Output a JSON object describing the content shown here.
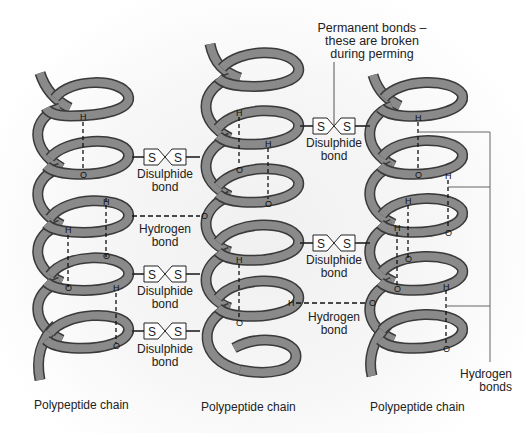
{
  "diagram": {
    "colors": {
      "helix_fill": "#8a8a8a",
      "helix_stroke": "#3a3a3a",
      "bond_line": "#222222",
      "background": "#f3f3f3"
    },
    "annotation_top": {
      "line1": "Permanent bonds –",
      "line2": "these are broken",
      "line3": "during perming"
    },
    "chains": [
      {
        "label": "Polypeptide chain",
        "position": "left"
      },
      {
        "label": "Polypeptide chain",
        "position": "middle"
      },
      {
        "label": "Polypeptide chain",
        "position": "right"
      }
    ],
    "bonds": [
      {
        "type": "disulphide",
        "between": "left-middle",
        "label1": "Disulphide",
        "label2": "bond",
        "atom1": "S",
        "atom2": "S"
      },
      {
        "type": "hydrogen",
        "between": "left-middle",
        "label1": "Hydrogen",
        "label2": "bond"
      },
      {
        "type": "disulphide",
        "between": "left-middle",
        "label1": "Disulphide",
        "label2": "bond",
        "atom1": "S",
        "atom2": "S"
      },
      {
        "type": "disulphide",
        "between": "left-middle",
        "label1": "Disulphide",
        "label2": "bond",
        "atom1": "S",
        "atom2": "S"
      },
      {
        "type": "disulphide",
        "between": "middle-right",
        "label1": "Disulphide",
        "label2": "bond",
        "atom1": "S",
        "atom2": "S"
      },
      {
        "type": "disulphide",
        "between": "middle-right",
        "label1": "Disulphide",
        "label2": "bond",
        "atom1": "S",
        "atom2": "S"
      },
      {
        "type": "hydrogen",
        "between": "middle-right",
        "label1": "Hydrogen",
        "label2": "bond"
      }
    ],
    "bracket_label": {
      "line1": "Hydrogen",
      "line2": "bonds"
    },
    "atoms": {
      "hydrogen": "H",
      "oxygen": "O"
    }
  }
}
